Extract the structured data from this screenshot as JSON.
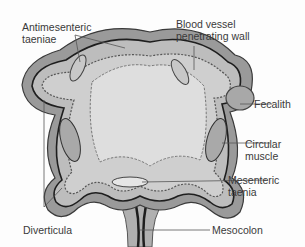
{
  "diagram": {
    "labels": {
      "antimesenteric_taeniae_line1": "Antimesenteric",
      "antimesenteric_taeniae_line2": "taeniae",
      "blood_vessel_line1": "Blood vessel",
      "blood_vessel_line2": "penetrating wall",
      "fecalith": "Fecalith",
      "circular_muscle_line1": "Circular",
      "circular_muscle_line2": "muscle",
      "mesenteric_taenia_line1": "Mesenteric",
      "mesenteric_taenia_line2": "taenia",
      "diverticula": "Diverticula",
      "mesocolon": "Mesocolon"
    },
    "colors": {
      "outer_wall": "#8a8a8a",
      "wall_fill": "#b9b9b9",
      "mucosa": "#d2d2d2",
      "lumen": "#dcdcdc",
      "dark_line": "#1e1e1e",
      "fecalith": "#a8a8a8",
      "text": "#3a3a3a"
    }
  }
}
